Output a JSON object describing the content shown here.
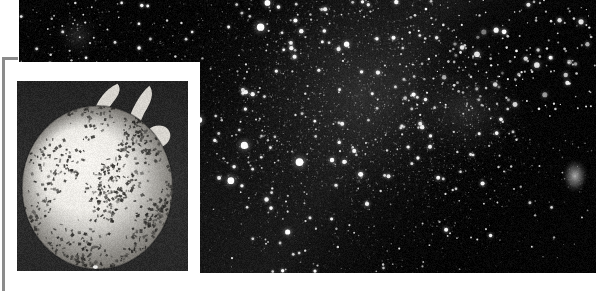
{
  "figure": {
    "title": "Star field with inset sphere photograph",
    "kind": "astronomical-photograph-composite",
    "width_px": 596,
    "height_px": 291,
    "background_color": "#ffffff"
  },
  "starfield": {
    "name": "main-star-field-plate",
    "description": "Dense black-and-white photographic star field with a rich concentration of stars toward the upper centre-right and a darker obscuring dust lane at the upper right",
    "bounds": {
      "left": 19,
      "top": 0,
      "width": 577,
      "height": 273
    },
    "sky_color": "#050505",
    "star_color": "#ffffff",
    "star_count": 2400,
    "glow_color": "#cfcfcf",
    "features": [
      {
        "label": "bright-star-clump-upper-left",
        "cx": 78,
        "cy": 36,
        "radius": 26,
        "intensity": 0.55
      },
      {
        "label": "dense-milky-concentration",
        "cx": 360,
        "cy": 92,
        "radius": 130,
        "intensity": 0.42
      },
      {
        "label": "bright-cluster-core",
        "cx": 468,
        "cy": 108,
        "radius": 62,
        "intensity": 0.6
      },
      {
        "label": "dark-dust-lane",
        "cx": 520,
        "cy": 38,
        "radius": 90,
        "intensity": -0.7
      },
      {
        "label": "faint-nebulous-patch-right",
        "cx": 575,
        "cy": 176,
        "radius": 14,
        "intensity": 0.5
      }
    ]
  },
  "inset": {
    "name": "inset-sphere-photograph",
    "description": "Framed black-and-white photograph of a pale, heavily mottled sphere with small stem-like protrusions at the top, set on a dark background",
    "mat_color": "#ffffff",
    "rule_color": "#8b8b8b",
    "photo_background": "#2b2b2b",
    "sphere": {
      "fill_color": "#e9e7e2",
      "mottle_color": "#3a3a38",
      "center_x": 0.47,
      "center_y": 0.56,
      "radius_x": 0.44,
      "radius_y": 0.43,
      "mottle_count": 1500
    },
    "bounds": {
      "left": 17,
      "top": 81,
      "width": 171,
      "height": 190
    }
  }
}
